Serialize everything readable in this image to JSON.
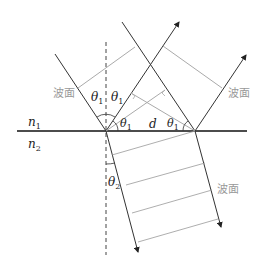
{
  "diagram": {
    "type": "wave-refraction-reflection",
    "labels": {
      "medium1": "n",
      "medium1_sub": "1",
      "medium2": "n",
      "medium2_sub": "2",
      "theta": "θ",
      "sub1": "1",
      "sub2": "2",
      "distance": "d",
      "wavefront": "波面"
    },
    "colors": {
      "ray": "#333333",
      "wavefront": "#aaaaaa",
      "interface": "#111111",
      "normal": "#444444",
      "label_gray": "#999999"
    }
  }
}
